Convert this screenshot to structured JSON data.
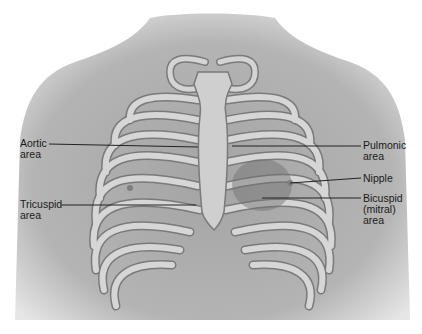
{
  "diagram": {
    "labels_left": [
      {
        "id": "aortic",
        "lines": [
          "Aortic",
          "area"
        ]
      },
      {
        "id": "tricuspid",
        "lines": [
          "Tricuspid",
          "area"
        ]
      }
    ],
    "labels_right": [
      {
        "id": "pulmonic",
        "lines": [
          "Pulmonic",
          "area"
        ]
      },
      {
        "id": "nipple",
        "lines": [
          "Nipple"
        ]
      },
      {
        "id": "bicuspid",
        "lines": [
          "Bicuspid",
          "(mitral)",
          "area"
        ]
      }
    ],
    "colors": {
      "skin": "#9a9a9a",
      "skin_light": "#c8c8c8",
      "rib": "#d8d8d8",
      "rib_edge": "#7a7a7a",
      "leader_line": "#222222"
    }
  }
}
